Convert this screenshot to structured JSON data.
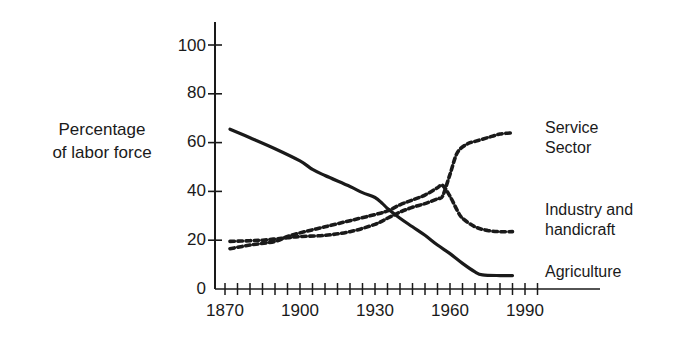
{
  "chart_data": {
    "type": "line",
    "title": "",
    "xlabel": "",
    "ylabel": "Percentage\nof labor force",
    "ylabel_line1": "Percentage",
    "ylabel_line2": "of labor force",
    "xlim": [
      1870,
      2000
    ],
    "ylim": [
      0,
      105
    ],
    "grid": false,
    "legend_position": "right-inline",
    "y_ticks": [
      0,
      20,
      40,
      60,
      80,
      100
    ],
    "y_tick_labels": [
      "0",
      "20",
      "40",
      "60",
      "80",
      "100"
    ],
    "x_ticks": [
      1870,
      1900,
      1930,
      1960,
      1990
    ],
    "x_tick_labels": [
      "1870",
      "1900",
      "1930",
      "1960",
      "1990"
    ],
    "x_minor_tick_interval": 5,
    "series": [
      {
        "name": "Agriculture",
        "label": "Agriculture",
        "style": "solid",
        "color": "#1a1a1a",
        "x": [
          1872,
          1880,
          1890,
          1900,
          1905,
          1910,
          1920,
          1925,
          1930,
          1933,
          1935,
          1940,
          1945,
          1950,
          1955,
          1960,
          1965,
          1970,
          1973,
          1980,
          1985
        ],
        "y": [
          65.5,
          62.0,
          57.5,
          52.5,
          49.0,
          46.5,
          42.0,
          39.5,
          37.5,
          35.0,
          33.0,
          29.0,
          25.5,
          22.0,
          18.0,
          14.5,
          10.5,
          7.0,
          5.8,
          5.5,
          5.5
        ]
      },
      {
        "name": "Industry and handicraft",
        "label": "Industry and\nhandicraft",
        "label_line1": "Industry and",
        "label_line2": "handicraft",
        "style": "dashed",
        "color": "#1a1a1a",
        "x": [
          1872,
          1880,
          1890,
          1895,
          1900,
          1910,
          1920,
          1930,
          1935,
          1940,
          1945,
          1950,
          1955,
          1957,
          1960,
          1963,
          1965,
          1970,
          1975,
          1980,
          1985
        ],
        "y": [
          16.5,
          18.0,
          19.5,
          21.5,
          23.0,
          25.5,
          28.0,
          30.5,
          32.0,
          34.5,
          36.5,
          38.5,
          41.5,
          42.5,
          38.0,
          32.0,
          29.0,
          25.5,
          24.0,
          23.5,
          23.5
        ]
      },
      {
        "name": "Service Sector",
        "label": "Service\nSector",
        "label_line1": "Service",
        "label_line2": "Sector",
        "style": "dashed",
        "color": "#1a1a1a",
        "x": [
          1872,
          1880,
          1885,
          1890,
          1895,
          1900,
          1910,
          1920,
          1930,
          1935,
          1940,
          1945,
          1950,
          1955,
          1957,
          1960,
          1963,
          1967,
          1970,
          1975,
          1980,
          1985
        ],
        "y": [
          19.5,
          19.8,
          20.0,
          20.5,
          21.0,
          21.5,
          22.0,
          23.5,
          26.5,
          29.0,
          31.5,
          33.5,
          35.0,
          37.0,
          38.0,
          47.0,
          56.0,
          59.5,
          60.5,
          62.0,
          63.5,
          64.0
        ]
      }
    ]
  },
  "labels": {
    "series_label_service": "Service\nSector",
    "series_label_industry": "Industry and\nhandicraft",
    "series_label_agriculture": "Agriculture"
  }
}
